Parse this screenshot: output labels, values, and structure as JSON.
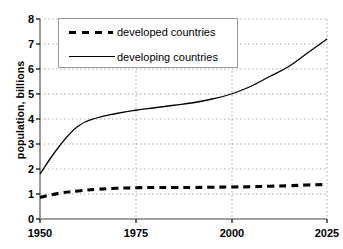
{
  "chart_data": {
    "type": "line",
    "title": "",
    "xlabel": "",
    "ylabel": "population, billions",
    "xlim": [
      1950,
      2025
    ],
    "ylim": [
      0,
      8
    ],
    "xticks": [
      "1950",
      "1975",
      "2000",
      "2025"
    ],
    "xtick_values": [
      1950,
      1975,
      2000,
      2025
    ],
    "yticks": [
      "0",
      "1",
      "2",
      "3",
      "4",
      "5",
      "6",
      "7",
      "8"
    ],
    "ytick_values": [
      0,
      1,
      2,
      3,
      4,
      5,
      6,
      7,
      8
    ],
    "grid": true,
    "grid_style": "dotted",
    "grid_color": "#a8a8a8",
    "legend_position": "upper-left-inside",
    "x": [
      1950,
      1955,
      1960,
      1965,
      1970,
      1975,
      1980,
      1985,
      1990,
      1995,
      2000,
      2005,
      2010,
      2015,
      2020,
      2025
    ],
    "series": [
      {
        "name": "developed countries",
        "style": "dashed",
        "color": "#000000",
        "values": [
          0.86,
          1.03,
          1.12,
          1.19,
          1.23,
          1.25,
          1.26,
          1.26,
          1.26,
          1.27,
          1.28,
          1.29,
          1.31,
          1.33,
          1.36,
          1.38
        ]
      },
      {
        "name": "developing countries",
        "style": "solid",
        "color": "#000000",
        "values": [
          1.8,
          2.9,
          3.72,
          4.05,
          4.22,
          4.35,
          4.45,
          4.55,
          4.65,
          4.8,
          5.0,
          5.3,
          5.7,
          6.1,
          6.65,
          7.2
        ]
      }
    ]
  },
  "legend": {
    "entries": [
      {
        "label": "developed countries",
        "style": "dashed"
      },
      {
        "label": "developing countries",
        "style": "solid"
      }
    ]
  },
  "axes": {
    "y_axis_title": "population, billions",
    "y_tick_labels": [
      "8",
      "7",
      "6",
      "5",
      "4",
      "3",
      "2",
      "1",
      "0"
    ],
    "x_tick_labels": [
      "1950",
      "1975",
      "2000",
      "2025"
    ]
  }
}
